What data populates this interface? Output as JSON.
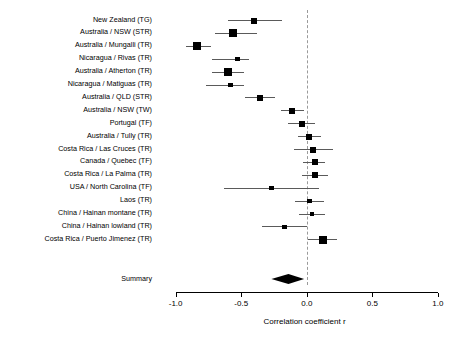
{
  "chart_data": {
    "type": "forest",
    "title": "",
    "xlabel": "Correlation coefficient r",
    "ylabel": "",
    "xlim": [
      -1.15,
      1.1
    ],
    "xticks": [
      -1.0,
      -0.5,
      0.0,
      0.5,
      1.0
    ],
    "xtick_labels": [
      "-1.0",
      "-0.5",
      "0.0",
      "0.5",
      "1.0"
    ],
    "grid": false,
    "reference_line": 0.0,
    "legend": "none",
    "studies": [
      {
        "label": "New Zealand (TG)",
        "r": -0.4,
        "ci_low": -0.6,
        "ci_high": -0.19,
        "weight": 2
      },
      {
        "label": "Australia / NSW (STR)",
        "r": -0.56,
        "ci_low": -0.7,
        "ci_high": -0.38,
        "weight": 3
      },
      {
        "label": "Australia / Mungalli (TR)",
        "r": -0.84,
        "ci_low": -0.92,
        "ci_high": -0.73,
        "weight": 3
      },
      {
        "label": "Nicaragua / Rivas (TR)",
        "r": -0.53,
        "ci_low": -0.72,
        "ci_high": -0.44,
        "weight": 1
      },
      {
        "label": "Australia / Atherton (TR)",
        "r": -0.6,
        "ci_low": -0.72,
        "ci_high": -0.48,
        "weight": 3
      },
      {
        "label": "Nicaragua / Matiguas (TR)",
        "r": -0.58,
        "ci_low": -0.77,
        "ci_high": -0.48,
        "weight": 1
      },
      {
        "label": "Australia / QLD (STR)",
        "r": -0.36,
        "ci_low": -0.47,
        "ci_high": -0.24,
        "weight": 2
      },
      {
        "label": "Australia / NSW (TW)",
        "r": -0.11,
        "ci_low": -0.2,
        "ci_high": -0.02,
        "weight": 2
      },
      {
        "label": "Portugal (TF)",
        "r": -0.04,
        "ci_low": -0.14,
        "ci_high": 0.06,
        "weight": 2
      },
      {
        "label": "Australia / Tully (TR)",
        "r": 0.02,
        "ci_low": -0.07,
        "ci_high": 0.11,
        "weight": 2
      },
      {
        "label": "Costa Rica / Las Cruces (TR)",
        "r": 0.05,
        "ci_low": -0.1,
        "ci_high": 0.2,
        "weight": 2
      },
      {
        "label": "Canada / Quebec (TF)",
        "r": 0.06,
        "ci_low": -0.03,
        "ci_high": 0.14,
        "weight": 2
      },
      {
        "label": "Costa Rica / La Palma (TR)",
        "r": 0.06,
        "ci_low": -0.04,
        "ci_high": 0.16,
        "weight": 2
      },
      {
        "label": "USA / North Carolina (TF)",
        "r": -0.27,
        "ci_low": -0.63,
        "ci_high": 0.09,
        "weight": 1
      },
      {
        "label": "Laos (TR)",
        "r": 0.02,
        "ci_low": -0.09,
        "ci_high": 0.13,
        "weight": 1
      },
      {
        "label": "China / Hainan montane (TR)",
        "r": 0.04,
        "ci_low": -0.06,
        "ci_high": 0.14,
        "weight": 1
      },
      {
        "label": "China / Hainan lowland (TR)",
        "r": -0.17,
        "ci_low": -0.34,
        "ci_high": 0.0,
        "weight": 1
      },
      {
        "label": "Costa Rica / Puerto Jimenez (TR)",
        "r": 0.12,
        "ci_low": 0.01,
        "ci_high": 0.23,
        "weight": 3
      }
    ],
    "summary": {
      "label": "Summary",
      "r": -0.14,
      "ci_low": -0.27,
      "ci_high": -0.02
    }
  }
}
